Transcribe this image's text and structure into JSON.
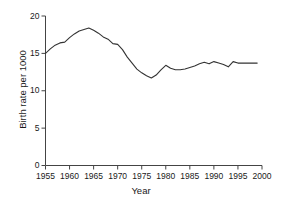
{
  "chart_data": {
    "type": "line",
    "title": "",
    "xlabel": "Year",
    "ylabel": "Birth rate per 1000",
    "xlim": [
      1955,
      2000
    ],
    "ylim": [
      0,
      20
    ],
    "xticks": [
      1955,
      1960,
      1965,
      1970,
      1975,
      1980,
      1985,
      1990,
      1995,
      2000
    ],
    "yticks": [
      0,
      5,
      10,
      15,
      20
    ],
    "grid": false,
    "legend": null,
    "series": [
      {
        "name": "Birth rate per 1000",
        "color": "#333333",
        "x": [
          1955,
          1956,
          1957,
          1958,
          1959,
          1960,
          1961,
          1962,
          1963,
          1964,
          1965,
          1966,
          1967,
          1968,
          1969,
          1970,
          1971,
          1972,
          1973,
          1974,
          1975,
          1976,
          1977,
          1978,
          1979,
          1980,
          1981,
          1982,
          1983,
          1984,
          1985,
          1986,
          1987,
          1988,
          1989,
          1990,
          1991,
          1992,
          1993,
          1994,
          1995,
          1996,
          1997,
          1998,
          1999
        ],
        "values": [
          15.0,
          15.6,
          16.1,
          16.4,
          16.5,
          17.1,
          17.6,
          18.0,
          18.2,
          18.4,
          18.1,
          17.7,
          17.2,
          16.9,
          16.3,
          16.2,
          15.5,
          14.5,
          13.7,
          12.9,
          12.4,
          12.0,
          11.7,
          12.1,
          12.8,
          13.4,
          13.0,
          12.8,
          12.8,
          12.9,
          13.1,
          13.3,
          13.6,
          13.8,
          13.6,
          13.9,
          13.7,
          13.5,
          13.2,
          13.9,
          13.7,
          13.7,
          13.7,
          13.7,
          13.7
        ]
      }
    ]
  }
}
